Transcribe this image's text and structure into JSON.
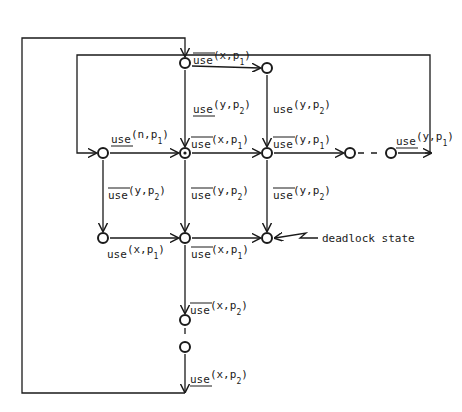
{
  "diagram": {
    "type": "state transition graph",
    "colors": {
      "ink": "#1a1a1a",
      "background": "#ffffff"
    },
    "annotation": {
      "deadlock": "deadlock state"
    },
    "labels": {
      "top_right": {
        "op": "use",
        "mark": "overline",
        "args": "(x,p",
        "sub": "1",
        "close": ")"
      },
      "mid_top_vert": {
        "op": "use",
        "mark": "underline",
        "args": "(y,p",
        "sub": "2",
        "close": ")"
      },
      "right_top_vert": {
        "op": "use",
        "mark": "none",
        "args": "(y,p",
        "sub": "2",
        "close": ")"
      },
      "left_node": {
        "op": "use",
        "mark": "underline",
        "args": "(n,p",
        "sub": "1",
        "close": ")"
      },
      "center_node": {
        "op": "use",
        "mark": "overline",
        "args": "(x,p",
        "sub": "1",
        "close": ")"
      },
      "right_node": {
        "op": "use",
        "mark": "overline",
        "args": "(y,p",
        "sub": "1",
        "close": ")"
      },
      "far_right": {
        "op": "use",
        "mark": "underline",
        "args": "(y,p",
        "sub": "1",
        "close": ")"
      },
      "left_vert": {
        "op": "use",
        "mark": "overline",
        "args": "(y,p",
        "sub": "2",
        "close": ")"
      },
      "center_vert": {
        "op": "use",
        "mark": "overline",
        "args": "(y,p",
        "sub": "2",
        "close": ")"
      },
      "right_vert": {
        "op": "use",
        "mark": "overline",
        "args": "(y,p",
        "sub": "2",
        "close": ")"
      },
      "bottom_left": {
        "op": "use",
        "mark": "none",
        "args": "(x,p",
        "sub": "1",
        "close": ")"
      },
      "bottom_center": {
        "op": "use",
        "mark": "overline",
        "args": "(x,p",
        "sub": "1",
        "close": ")"
      },
      "lower_vert": {
        "op": "use",
        "mark": "overline",
        "args": "(x,p",
        "sub": "2",
        "close": ")"
      },
      "bottom_vert": {
        "op": "use",
        "mark": "underline",
        "args": "(x,p",
        "sub": "2",
        "close": ")"
      }
    },
    "nodes": [
      {
        "id": "A",
        "x": 185,
        "y": 63
      },
      {
        "id": "B",
        "x": 267,
        "y": 68
      },
      {
        "id": "C",
        "x": 103,
        "y": 153
      },
      {
        "id": "D",
        "x": 185,
        "y": 153,
        "initial": true
      },
      {
        "id": "E",
        "x": 267,
        "y": 153
      },
      {
        "id": "F",
        "x": 350,
        "y": 153
      },
      {
        "id": "G",
        "x": 391,
        "y": 153
      },
      {
        "id": "H",
        "x": 103,
        "y": 238
      },
      {
        "id": "I",
        "x": 185,
        "y": 238
      },
      {
        "id": "J",
        "x": 267,
        "y": 238,
        "deadlock": true
      },
      {
        "id": "K",
        "x": 185,
        "y": 320
      },
      {
        "id": "L",
        "x": 185,
        "y": 347
      }
    ]
  }
}
